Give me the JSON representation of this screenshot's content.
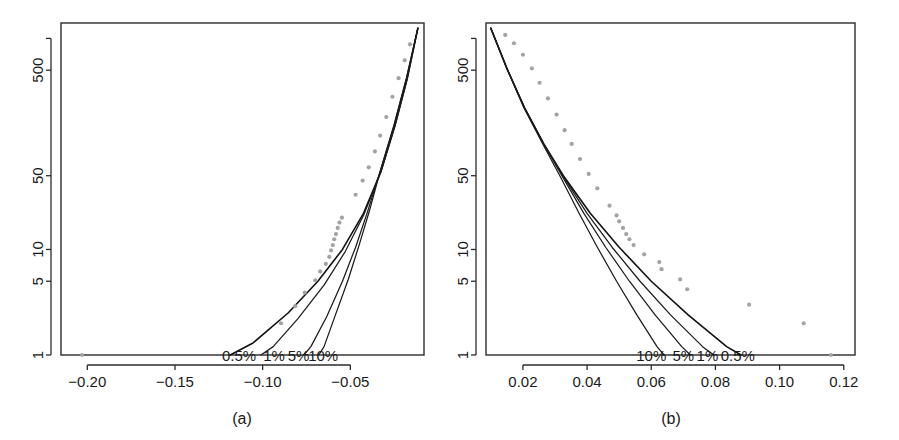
{
  "figure": {
    "caption_a": "(a)",
    "caption_b": "(b)"
  },
  "chart_data": [
    {
      "id": "panel-a",
      "type": "line",
      "title": "(a)",
      "xlabel": "",
      "ylabel": "",
      "xlim": [
        -0.215,
        -0.008
      ],
      "ylim": [
        1,
        1400
      ],
      "yscale": "log",
      "grid": false,
      "legend": "inline-annotations",
      "xticks": [
        -0.2,
        -0.15,
        -0.1,
        -0.05
      ],
      "xticklabels": [
        "−0.20",
        "−0.15",
        "−0.10",
        "−0.05"
      ],
      "yticks": [
        1,
        5,
        10,
        50,
        500
      ],
      "yticklabels": [
        "1",
        "5",
        "10",
        "50",
        "500"
      ],
      "extra_yticks": [
        1000
      ],
      "annotations": [
        {
          "text": "0.5%",
          "x": -0.1135,
          "y": 1
        },
        {
          "text": "1%",
          "x": -0.0935,
          "y": 1
        },
        {
          "text": "5%",
          "x": -0.0795,
          "y": 1
        },
        {
          "text": "10%",
          "x": -0.0655,
          "y": 1
        }
      ],
      "series": [
        {
          "name": "0.5% tail fit",
          "points": [
            [
              -0.0115,
              1250
            ],
            [
              -0.0175,
              420
            ],
            [
              -0.0245,
              150
            ],
            [
              -0.0325,
              55
            ],
            [
              -0.0425,
              22
            ],
            [
              -0.0545,
              10
            ],
            [
              -0.0685,
              5
            ],
            [
              -0.0855,
              2.5
            ],
            [
              -0.1055,
              1.3
            ],
            [
              -0.1185,
              1.0
            ]
          ]
        },
        {
          "name": "1% tail fit",
          "points": [
            [
              -0.0115,
              1250
            ],
            [
              -0.0175,
              420
            ],
            [
              -0.0245,
              150
            ],
            [
              -0.0325,
              55
            ],
            [
              -0.0425,
              21
            ],
            [
              -0.053,
              9.5
            ],
            [
              -0.065,
              4.6
            ],
            [
              -0.08,
              2.2
            ],
            [
              -0.094,
              1.2
            ],
            [
              -0.101,
              1.0
            ]
          ]
        },
        {
          "name": "5% tail fit",
          "points": [
            [
              -0.0115,
              1250
            ],
            [
              -0.018,
              420
            ],
            [
              -0.025,
              150
            ],
            [
              -0.033,
              55
            ],
            [
              -0.0405,
              22
            ],
            [
              -0.047,
              10.5
            ],
            [
              -0.0545,
              5.0
            ],
            [
              -0.0635,
              2.3
            ],
            [
              -0.0725,
              1.2
            ],
            [
              -0.0765,
              1.0
            ]
          ]
        },
        {
          "name": "10% tail fit",
          "points": [
            [
              -0.0115,
              1250
            ],
            [
              -0.018,
              420
            ],
            [
              -0.0252,
              150
            ],
            [
              -0.033,
              55
            ],
            [
              -0.0392,
              23
            ],
            [
              -0.045,
              11
            ],
            [
              -0.0512,
              5.2
            ],
            [
              -0.0585,
              2.4
            ],
            [
              -0.065,
              1.2
            ],
            [
              -0.068,
              1.0
            ]
          ]
        }
      ],
      "scatter": {
        "name": "empirical exceedances",
        "color": "#a3a3a3",
        "points": [
          [
            -0.203,
            1.0
          ],
          [
            -0.0895,
            2.0
          ],
          [
            -0.0815,
            2.9
          ],
          [
            -0.076,
            3.9
          ],
          [
            -0.07,
            5.1
          ],
          [
            -0.0672,
            6.2
          ],
          [
            -0.064,
            7.3
          ],
          [
            -0.062,
            8.5
          ],
          [
            -0.061,
            9.8
          ],
          [
            -0.06,
            11.0
          ],
          [
            -0.0592,
            12.5
          ],
          [
            -0.0582,
            14.0
          ],
          [
            -0.0572,
            16.0
          ],
          [
            -0.0562,
            18.0
          ],
          [
            -0.0548,
            20.0
          ],
          [
            -0.047,
            33.0
          ],
          [
            -0.043,
            45.0
          ],
          [
            -0.0395,
            60.0
          ],
          [
            -0.036,
            85.0
          ],
          [
            -0.033,
            120.0
          ],
          [
            -0.0295,
            180.0
          ],
          [
            -0.026,
            280.0
          ],
          [
            -0.0225,
            420.0
          ],
          [
            -0.019,
            620.0
          ],
          [
            -0.016,
            880.0
          ]
        ]
      }
    },
    {
      "id": "panel-b",
      "type": "line",
      "title": "(b)",
      "xlabel": "",
      "ylabel": "",
      "xlim": [
        0.0085,
        0.1235
      ],
      "ylim": [
        1,
        1400
      ],
      "yscale": "log",
      "grid": false,
      "legend": "inline-annotations",
      "xticks": [
        0.02,
        0.04,
        0.06,
        0.08,
        0.1,
        0.12
      ],
      "xticklabels": [
        "0.02",
        "0.04",
        "0.06",
        "0.08",
        "0.10",
        "0.12"
      ],
      "yticks": [
        1,
        5,
        10,
        50,
        500
      ],
      "yticklabels": [
        "1",
        "5",
        "10",
        "50",
        "500"
      ],
      "extra_yticks": [
        1000
      ],
      "annotations": [
        {
          "text": "10%",
          "x": 0.06,
          "y": 1
        },
        {
          "text": "5%",
          "x": 0.07,
          "y": 1
        },
        {
          "text": "1%",
          "x": 0.0775,
          "y": 1
        },
        {
          "text": "0.5%",
          "x": 0.087,
          "y": 1
        }
      ],
      "series": [
        {
          "name": "0.5% tail fit",
          "points": [
            [
              0.01,
              1250
            ],
            [
              0.015,
              520
            ],
            [
              0.0205,
              220
            ],
            [
              0.0265,
              100
            ],
            [
              0.033,
              48
            ],
            [
              0.041,
              22
            ],
            [
              0.05,
              10.5
            ],
            [
              0.06,
              5.0
            ],
            [
              0.0715,
              2.4
            ],
            [
              0.0835,
              1.2
            ],
            [
              0.088,
              1.0
            ]
          ]
        },
        {
          "name": "1% tail fit",
          "points": [
            [
              0.01,
              1250
            ],
            [
              0.015,
              520
            ],
            [
              0.0205,
              220
            ],
            [
              0.0265,
              100
            ],
            [
              0.0328,
              48
            ],
            [
              0.04,
              22
            ],
            [
              0.0478,
              10.5
            ],
            [
              0.0565,
              5.0
            ],
            [
              0.066,
              2.4
            ],
            [
              0.076,
              1.2
            ],
            [
              0.0795,
              1.0
            ]
          ]
        },
        {
          "name": "5% tail fit",
          "points": [
            [
              0.01,
              1250
            ],
            [
              0.015,
              520
            ],
            [
              0.0205,
              220
            ],
            [
              0.0265,
              100
            ],
            [
              0.0325,
              48
            ],
            [
              0.039,
              22
            ],
            [
              0.0458,
              10.5
            ],
            [
              0.0532,
              5.0
            ],
            [
              0.0612,
              2.4
            ],
            [
              0.0695,
              1.2
            ],
            [
              0.0722,
              1.0
            ]
          ]
        },
        {
          "name": "10% tail fit",
          "points": [
            [
              0.01,
              1250
            ],
            [
              0.015,
              520
            ],
            [
              0.0203,
              220
            ],
            [
              0.0262,
              100
            ],
            [
              0.0318,
              48
            ],
            [
              0.0375,
              22
            ],
            [
              0.0432,
              10.5
            ],
            [
              0.0492,
              5.0
            ],
            [
              0.0555,
              2.4
            ],
            [
              0.0618,
              1.2
            ],
            [
              0.064,
              1.0
            ]
          ]
        }
      ],
      "scatter": {
        "name": "empirical exceedances",
        "color": "#a3a3a3",
        "points": [
          [
            0.116,
            1.0
          ],
          [
            0.1075,
            2.0
          ],
          [
            0.0905,
            3.0
          ],
          [
            0.0712,
            4.2
          ],
          [
            0.069,
            5.2
          ],
          [
            0.0632,
            6.5
          ],
          [
            0.0625,
            7.6
          ],
          [
            0.0578,
            9.0
          ],
          [
            0.0545,
            11.0
          ],
          [
            0.0532,
            12.5
          ],
          [
            0.0522,
            14.0
          ],
          [
            0.0512,
            16.0
          ],
          [
            0.05,
            18.5
          ],
          [
            0.0492,
            21.0
          ],
          [
            0.047,
            26.0
          ],
          [
            0.0432,
            38.0
          ],
          [
            0.0405,
            52.0
          ],
          [
            0.0378,
            72.0
          ],
          [
            0.0352,
            100.0
          ],
          [
            0.033,
            135.0
          ],
          [
            0.0305,
            190.0
          ],
          [
            0.0278,
            270.0
          ],
          [
            0.0252,
            380.0
          ],
          [
            0.0228,
            520.0
          ],
          [
            0.02,
            700.0
          ],
          [
            0.0172,
            900.0
          ],
          [
            0.0145,
            1080.0
          ]
        ]
      }
    }
  ]
}
